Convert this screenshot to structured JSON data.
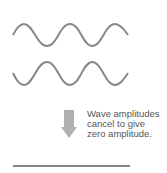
{
  "diagram": {
    "waves": [
      {
        "name": "wave-1",
        "phase": "starts-up",
        "color": "#888888"
      },
      {
        "name": "wave-2",
        "phase": "starts-down",
        "color": "#888888"
      }
    ],
    "arrow": {
      "direction": "down",
      "color": "#b0b0b0"
    },
    "caption_lines": [
      "Wave amplitudes",
      "cancel to give",
      "zero amplitude."
    ],
    "result": {
      "name": "flat-line",
      "color": "#888888"
    }
  }
}
